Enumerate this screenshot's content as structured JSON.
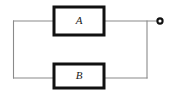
{
  "figure": {
    "type": "block-diagram",
    "background_color": "#ffffff",
    "wire_color": "#8a8a8a",
    "block_border_color": "#111111",
    "block_fill_color": "#ffffff",
    "label_color": "#1a1a1a"
  },
  "blocks": [
    {
      "id": "block-a",
      "label": "A",
      "position": "top",
      "x": 54,
      "y": 7,
      "width": 50,
      "height": 28,
      "center_x": 79,
      "center_y": 21
    },
    {
      "id": "block-b",
      "label": "B",
      "position": "bottom",
      "x": 54,
      "y": 64,
      "width": 50,
      "height": 24,
      "center_x": 79,
      "center_y": 76
    }
  ],
  "wires": [
    {
      "id": "wire-left-vertical",
      "path": "M 13.5 21 L 13.5 78"
    },
    {
      "id": "wire-left-to-block-a",
      "path": "M 13.5 21 L 55 21"
    },
    {
      "id": "wire-left-to-block-b",
      "path": "M 13.5 78 L 55 78"
    },
    {
      "id": "wire-block-a-to-terminal",
      "path": "M 103 21 L 158 21"
    },
    {
      "id": "wire-block-b-to-right-node",
      "path": "M 103 78 L 147 78"
    },
    {
      "id": "wire-right-vertical",
      "path": "M 147 21 L 147 78"
    }
  ],
  "terminal": {
    "id": "output-terminal",
    "style": "open-circle-node",
    "cx": 160,
    "cy": 21,
    "radius": 2.6
  }
}
